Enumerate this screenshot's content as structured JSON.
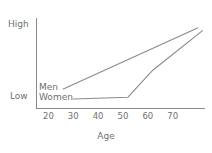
{
  "chart_data": {
    "type": "line",
    "title": "",
    "xlabel": "Age",
    "ylabel": "",
    "grid": false,
    "legend": "inline-at-line-start",
    "xlim": [
      15,
      83
    ],
    "ylim": [
      0,
      1
    ],
    "x_ticks": [
      {
        "label": "20",
        "value": 20
      },
      {
        "label": "30",
        "value": 30
      },
      {
        "label": "40",
        "value": 40
      },
      {
        "label": "50",
        "value": 50
      },
      {
        "label": "60",
        "value": 60
      },
      {
        "label": "70",
        "value": 70
      }
    ],
    "y_ticks": [
      {
        "label": "Low",
        "value": 0.12
      },
      {
        "label": "High",
        "value": 0.9
      }
    ],
    "series": [
      {
        "name": "Men",
        "color": "#8a8a8a",
        "points": [
          {
            "x": 26,
            "y": 0.21
          },
          {
            "x": 80,
            "y": 0.89
          }
        ]
      },
      {
        "name": "Women",
        "color": "#8a8a8a",
        "points": [
          {
            "x": 30,
            "y": 0.1
          },
          {
            "x": 52,
            "y": 0.12
          },
          {
            "x": 62,
            "y": 0.42
          },
          {
            "x": 82,
            "y": 0.86
          }
        ]
      }
    ],
    "axis_color": "#8a8a8a",
    "text_color": "#6f6f6f",
    "background": "#ffffff"
  },
  "axes": {
    "y_high_label": "High",
    "y_low_label": "Low",
    "x_title": "Age"
  },
  "series_labels": {
    "men": "Men",
    "women": "Women"
  },
  "x_tick_labels": [
    "20",
    "30",
    "40",
    "50",
    "60",
    "70"
  ]
}
